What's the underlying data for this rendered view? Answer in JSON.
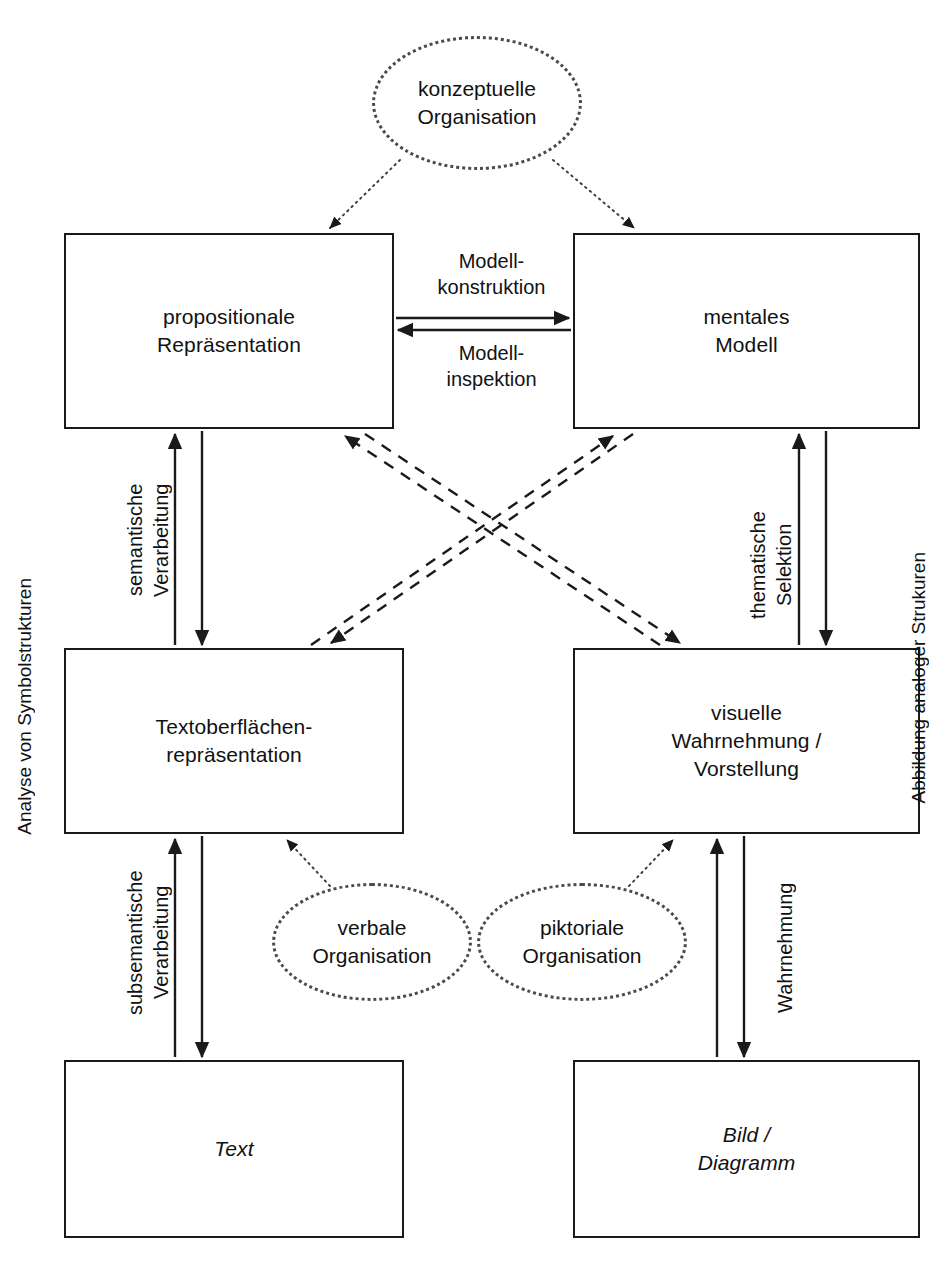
{
  "diagram": {
    "nodes": [
      {
        "id": "konzeptuelle-organisation",
        "shape": "ellipse",
        "label": "konzeptuelle\nOrganisation",
        "x": 372,
        "y": 36,
        "w": 210,
        "h": 134
      },
      {
        "id": "propositionale-repraesentation",
        "shape": "rect",
        "label": "propositionale\nRepräsentation",
        "x": 64,
        "y": 233,
        "w": 330,
        "h": 196
      },
      {
        "id": "mentales-modell",
        "shape": "rect",
        "label": "mentales\nModell",
        "x": 573,
        "y": 233,
        "w": 347,
        "h": 196
      },
      {
        "id": "textoberflaechenrepraesentation",
        "shape": "rect",
        "label": "Textoberflächen-\nrepräsentation",
        "x": 64,
        "y": 648,
        "w": 340,
        "h": 186
      },
      {
        "id": "visuelle-wahrnehmung-vorstellung",
        "shape": "rect",
        "label": "visuelle\nWahrnehmung /\nVorstellung",
        "x": 573,
        "y": 648,
        "w": 347,
        "h": 186
      },
      {
        "id": "verbale-organisation",
        "shape": "ellipse",
        "label": "verbale\nOrganisation",
        "x": 272,
        "y": 883,
        "w": 200,
        "h": 118
      },
      {
        "id": "piktoriale-organisation",
        "shape": "ellipse",
        "label": "piktoriale\nOrganisation",
        "x": 477,
        "y": 883,
        "w": 210,
        "h": 118
      },
      {
        "id": "text",
        "shape": "rect",
        "label": "Text",
        "italic": true,
        "x": 64,
        "y": 1060,
        "w": 340,
        "h": 178
      },
      {
        "id": "bild-diagramm",
        "shape": "rect",
        "label": "Bild /\nDiagramm",
        "italic": true,
        "x": 573,
        "y": 1060,
        "w": 347,
        "h": 178
      }
    ],
    "edge_labels": [
      {
        "id": "modellkonstruktion",
        "text": "Modell-\nkonstruktion",
        "orientation": "horizontal",
        "x": 424,
        "y": 248,
        "w": 135
      },
      {
        "id": "modellinspektion",
        "text": "Modell-\ninspektion",
        "orientation": "horizontal",
        "x": 424,
        "y": 340,
        "w": 135
      },
      {
        "id": "semantische-verarbeitung",
        "text": "semantische\nVerarbeitung",
        "orientation": "vertical",
        "x": 122,
        "y": 447,
        "h": 186
      },
      {
        "id": "thematische-selektion",
        "text": "thematische\nSelektion",
        "orientation": "vertical",
        "x": 745,
        "y": 490,
        "h": 150
      },
      {
        "id": "subsemantische-verarbeitung",
        "text": "subsemantische\nVerarbeitung",
        "orientation": "vertical",
        "x": 122,
        "y": 845,
        "h": 195
      },
      {
        "id": "wahrnehmung",
        "text": "Wahrnehmung",
        "orientation": "vertical",
        "x": 772,
        "y": 865,
        "h": 165
      }
    ],
    "side_labels": [
      {
        "id": "analyse-von-symbolstrukturen",
        "text": "Analyse von Symbolstrukturen",
        "side": "left",
        "x": 14,
        "y": 578
      },
      {
        "id": "abbildung-analoger-strukuren",
        "text": "Abbildung analoger Strukuren",
        "side": "right",
        "x": 908,
        "y": 552
      }
    ],
    "colors": {
      "line": "#1a1a1a",
      "dotted": "#4a4a4a",
      "text": "#111111",
      "background": "#ffffff"
    }
  }
}
